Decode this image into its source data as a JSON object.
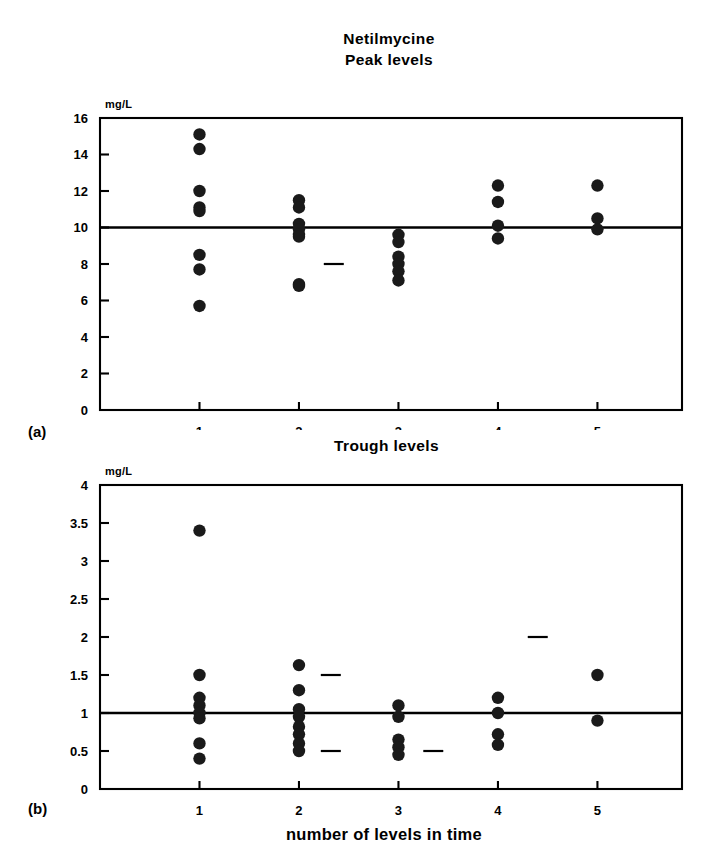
{
  "figure": {
    "title_lines": [
      "Netilmycine",
      "Peak levels"
    ],
    "subtitle_trough": "Trough levels",
    "xaxis_title": "number of levels in time",
    "panel_a_tag": "(a)",
    "panel_b_tag": "(b)",
    "unit_label_a": "mg/L",
    "unit_label_b": "mg/L",
    "marker_color": "#1a1a1a",
    "axis_color": "#000000",
    "background_color": "#ffffff"
  },
  "chart_data": [
    {
      "id": "panel-a-peak-levels",
      "type": "scatter",
      "title": "Netilmycine Peak levels",
      "panel_tag": "(a)",
      "xlabel": "number of levels in time",
      "ylabel": "mg/L",
      "xlim": [
        0.0,
        5.85
      ],
      "ylim": [
        0,
        16
      ],
      "yticks": [
        0,
        2,
        4,
        6,
        8,
        10,
        12,
        14,
        16
      ],
      "ytick_labels": [
        "0",
        "2",
        "4",
        "6",
        "8",
        "10",
        "12",
        "14",
        "16"
      ],
      "xticks": [
        1,
        2,
        3,
        4,
        5
      ],
      "xtick_labels": [
        "1",
        "2",
        "3",
        "4",
        "5"
      ],
      "grid": false,
      "legend": "none",
      "reference_line": {
        "y": 10,
        "label": "target peak level"
      },
      "series": [
        {
          "name": "Peak levels",
          "points": [
            {
              "x": 1,
              "y": 15.1
            },
            {
              "x": 1,
              "y": 14.3
            },
            {
              "x": 1,
              "y": 12.0
            },
            {
              "x": 1,
              "y": 11.1
            },
            {
              "x": 1,
              "y": 10.9
            },
            {
              "x": 1,
              "y": 8.5
            },
            {
              "x": 1,
              "y": 7.7
            },
            {
              "x": 1,
              "y": 5.7
            },
            {
              "x": 2,
              "y": 11.5
            },
            {
              "x": 2,
              "y": 11.1
            },
            {
              "x": 2,
              "y": 10.2
            },
            {
              "x": 2,
              "y": 9.9
            },
            {
              "x": 2,
              "y": 9.6
            },
            {
              "x": 2,
              "y": 9.5
            },
            {
              "x": 2,
              "y": 6.9
            },
            {
              "x": 2,
              "y": 6.8
            },
            {
              "x": 3,
              "y": 9.6
            },
            {
              "x": 3,
              "y": 9.2
            },
            {
              "x": 3,
              "y": 8.4
            },
            {
              "x": 3,
              "y": 8.0
            },
            {
              "x": 3,
              "y": 7.6
            },
            {
              "x": 3,
              "y": 7.1
            },
            {
              "x": 4,
              "y": 12.3
            },
            {
              "x": 4,
              "y": 11.4
            },
            {
              "x": 4,
              "y": 10.1
            },
            {
              "x": 4,
              "y": 9.4
            },
            {
              "x": 5,
              "y": 12.3
            },
            {
              "x": 5,
              "y": 10.5
            },
            {
              "x": 5,
              "y": 9.9
            }
          ]
        }
      ],
      "dashes": [
        {
          "x": 2.35,
          "y": 8.0
        }
      ]
    },
    {
      "id": "panel-b-trough-levels",
      "type": "scatter",
      "title": "Trough levels",
      "panel_tag": "(b)",
      "xlabel": "number of levels in time",
      "ylabel": "mg/L",
      "xlim": [
        0.0,
        5.85
      ],
      "ylim": [
        0,
        4
      ],
      "yticks": [
        0,
        0.5,
        1,
        1.5,
        2,
        2.5,
        3,
        3.5,
        4
      ],
      "ytick_labels": [
        "0",
        "0.5",
        "1",
        "1.5",
        "2",
        "2.5",
        "3",
        "3.5",
        "4"
      ],
      "xticks": [
        1,
        2,
        3,
        4,
        5
      ],
      "xtick_labels": [
        "1",
        "2",
        "3",
        "4",
        "5"
      ],
      "grid": false,
      "legend": "none",
      "reference_line": {
        "y": 1,
        "label": "target trough level"
      },
      "series": [
        {
          "name": "Trough levels",
          "points": [
            {
              "x": 1,
              "y": 3.4
            },
            {
              "x": 1,
              "y": 1.5
            },
            {
              "x": 1,
              "y": 1.2
            },
            {
              "x": 1,
              "y": 1.1
            },
            {
              "x": 1,
              "y": 1.0
            },
            {
              "x": 1,
              "y": 0.93
            },
            {
              "x": 1,
              "y": 0.6
            },
            {
              "x": 1,
              "y": 0.4
            },
            {
              "x": 2,
              "y": 1.63
            },
            {
              "x": 2,
              "y": 1.3
            },
            {
              "x": 2,
              "y": 1.05
            },
            {
              "x": 2,
              "y": 0.95
            },
            {
              "x": 2,
              "y": 0.82
            },
            {
              "x": 2,
              "y": 0.72
            },
            {
              "x": 2,
              "y": 0.6
            },
            {
              "x": 2,
              "y": 0.5
            },
            {
              "x": 3,
              "y": 1.1
            },
            {
              "x": 3,
              "y": 0.95
            },
            {
              "x": 3,
              "y": 0.65
            },
            {
              "x": 3,
              "y": 0.55
            },
            {
              "x": 3,
              "y": 0.45
            },
            {
              "x": 4,
              "y": 1.2
            },
            {
              "x": 4,
              "y": 1.0
            },
            {
              "x": 4,
              "y": 0.72
            },
            {
              "x": 4,
              "y": 0.58
            },
            {
              "x": 5,
              "y": 1.5
            },
            {
              "x": 5,
              "y": 0.9
            }
          ]
        }
      ],
      "dashes": [
        {
          "x": 2.32,
          "y": 1.5
        },
        {
          "x": 2.32,
          "y": 0.5
        },
        {
          "x": 4.4,
          "y": 2.0
        },
        {
          "x": 3.35,
          "y": 0.5
        }
      ]
    }
  ]
}
